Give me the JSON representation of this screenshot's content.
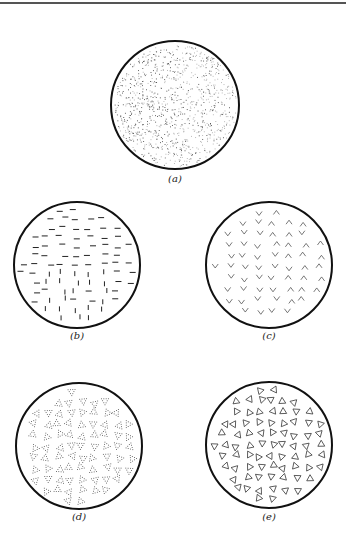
{
  "figure": {
    "panels": [
      {
        "id": "a",
        "label": "(a)",
        "pattern": "random-dots",
        "cx": 175,
        "cy": 105,
        "r": 64,
        "cap_x": 175,
        "cap_y": 179
      },
      {
        "id": "b",
        "label": "(b)",
        "pattern": "dashes-horizontal-vertical",
        "cx": 77,
        "cy": 265,
        "r": 63,
        "cap_x": 77,
        "cap_y": 336
      },
      {
        "id": "c",
        "label": "(c)",
        "pattern": "chevrons",
        "cx": 269,
        "cy": 265,
        "r": 63,
        "cap_x": 269,
        "cap_y": 336
      },
      {
        "id": "d",
        "label": "(d)",
        "pattern": "dotted-triangles",
        "cx": 79,
        "cy": 446,
        "r": 63,
        "cap_x": 79,
        "cap_y": 517
      },
      {
        "id": "e",
        "label": "(e)",
        "pattern": "outlined-triangles",
        "cx": 269,
        "cy": 445,
        "r": 63,
        "cap_x": 269,
        "cap_y": 517
      }
    ]
  }
}
